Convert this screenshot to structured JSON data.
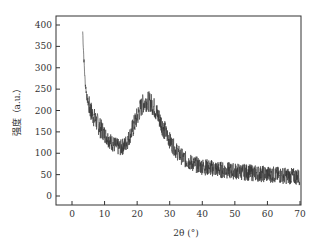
{
  "chart_data": {
    "type": "line",
    "title": "",
    "xlabel": "2θ (°)",
    "ylabel": "强度（a.u.）",
    "xlim": [
      -5,
      70
    ],
    "ylim": [
      -15,
      420
    ],
    "x_ticks": [
      0,
      10,
      20,
      30,
      40,
      50,
      60,
      70
    ],
    "y_ticks": [
      0,
      50,
      100,
      150,
      200,
      250,
      300,
      350,
      400
    ],
    "grid": false,
    "legend": null,
    "series": [
      {
        "name": "XRD pattern",
        "color": "#333333",
        "noise": 22,
        "points": [
          [
            3.3,
            385
          ],
          [
            3.6,
            330
          ],
          [
            4,
            270
          ],
          [
            4.5,
            235
          ],
          [
            5,
            215
          ],
          [
            6,
            195
          ],
          [
            7,
            180
          ],
          [
            8,
            168
          ],
          [
            9,
            155
          ],
          [
            10,
            145
          ],
          [
            11,
            135
          ],
          [
            12,
            126
          ],
          [
            13,
            120
          ],
          [
            14,
            115
          ],
          [
            15,
            113
          ],
          [
            16,
            118
          ],
          [
            17,
            128
          ],
          [
            18,
            145
          ],
          [
            19,
            165
          ],
          [
            20,
            185
          ],
          [
            21,
            205
          ],
          [
            22,
            218
          ],
          [
            23,
            222
          ],
          [
            24,
            220
          ],
          [
            25,
            210
          ],
          [
            26,
            195
          ],
          [
            27,
            178
          ],
          [
            28,
            160
          ],
          [
            29,
            145
          ],
          [
            30,
            130
          ],
          [
            31,
            117
          ],
          [
            32,
            106
          ],
          [
            33,
            97
          ],
          [
            34,
            90
          ],
          [
            35,
            84
          ],
          [
            37,
            76
          ],
          [
            40,
            69
          ],
          [
            43,
            65
          ],
          [
            46,
            61
          ],
          [
            50,
            58
          ],
          [
            54,
            55
          ],
          [
            58,
            52
          ],
          [
            62,
            50
          ],
          [
            66,
            47
          ],
          [
            70,
            45
          ]
        ]
      }
    ]
  }
}
